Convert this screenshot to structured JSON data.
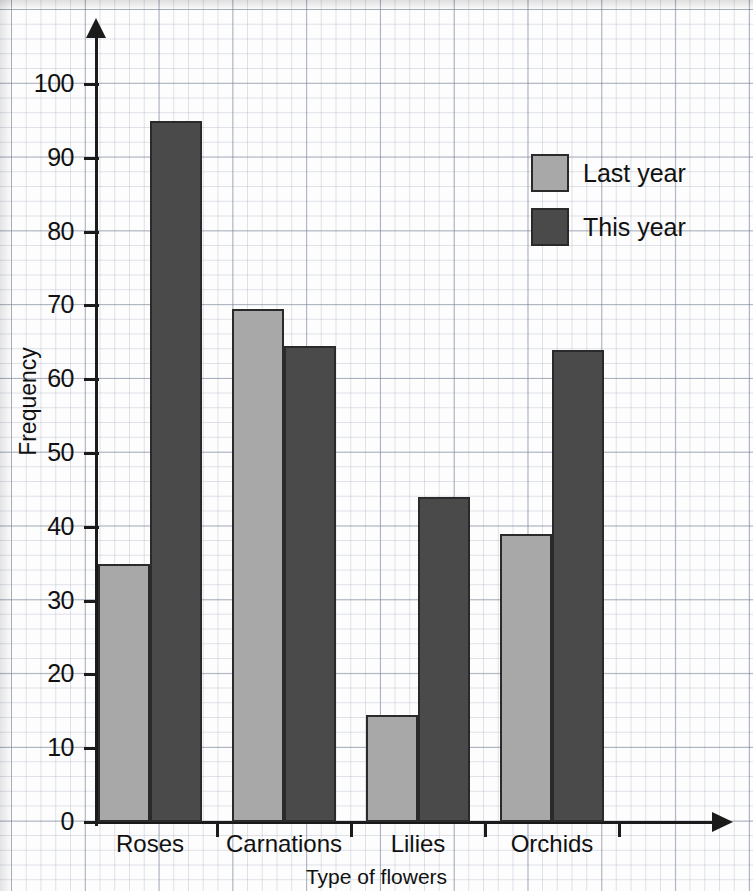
{
  "chart_data": {
    "type": "bar",
    "title": "",
    "xlabel": "Type of flowers",
    "ylabel": "Frequency",
    "categories": [
      "Roses",
      "Carnations",
      "Lilies",
      "Orchids"
    ],
    "series": [
      {
        "name": "Last year",
        "color": "#a8a8a8",
        "values": [
          35,
          69.5,
          14.5,
          39
        ]
      },
      {
        "name": "This year",
        "color": "#4a4a4a",
        "values": [
          95,
          64.5,
          44,
          64
        ]
      }
    ],
    "ylim": [
      0,
      100
    ],
    "ytick_labels": [
      "100",
      "90",
      "80",
      "70",
      "60",
      "50",
      "40",
      "30",
      "20",
      "10",
      "0"
    ],
    "ytick_values": [
      100,
      90,
      80,
      70,
      60,
      50,
      40,
      30,
      20,
      10,
      0
    ],
    "grid": "graph-paper",
    "legend_position": "top-right"
  },
  "axes": {
    "y_title": "Frequency",
    "x_title": "Type of flowers"
  },
  "legend": {
    "items": [
      {
        "label": "Last year",
        "swatch": "light-gray-swatch"
      },
      {
        "label": "This year",
        "swatch": "dark-gray-swatch"
      }
    ]
  },
  "colors": {
    "last_year": "#a8a8a8",
    "this_year": "#4a4a4a",
    "axis": "#1b1b1b",
    "bar_outline": "#2a2a2a",
    "paper": "#fdfdfd"
  }
}
